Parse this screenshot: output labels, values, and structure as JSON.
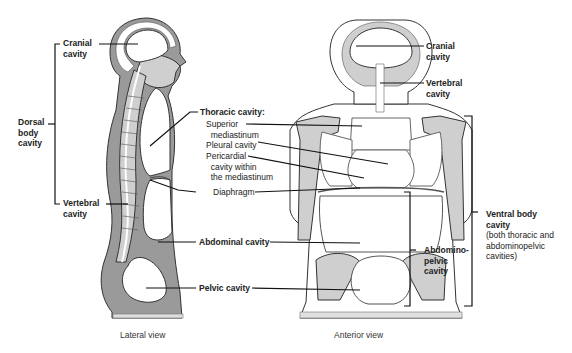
{
  "figure": {
    "lateral_view": {
      "caption": "Lateral view",
      "labels": {
        "cranial": "Cranial\ncavity",
        "dorsal": "Dorsal\nbody\ncavity",
        "vertebral": "Vertebral\ncavity"
      }
    },
    "center_labels": {
      "thoracic": "Thoracic cavity:",
      "superior": "Superior\n  mediastinum",
      "pleural": "Pleural cavity",
      "pericardial": "Pericardial\n  cavity within\n  the mediastinum",
      "diaphragm": "Diaphragm",
      "abdominal": "Abdominal cavity",
      "pelvic": "Pelvic cavity"
    },
    "anterior_view": {
      "caption": "Anterior view",
      "labels": {
        "cranial": "Cranial\ncavity",
        "vertebral": "Vertebral\ncavity",
        "abdominopelvic": "Abdomino-\npelvic\ncavity",
        "ventral_title": "Ventral body\ncavity",
        "ventral_note": "(both thoracic and\nabdominopelvic\ncavities)"
      }
    },
    "colors": {
      "tissue_dark": "#9a9a9a",
      "tissue_light": "#cfcfcf",
      "outline": "#333333",
      "cavity": "#ffffff",
      "leader": "#111111"
    }
  }
}
